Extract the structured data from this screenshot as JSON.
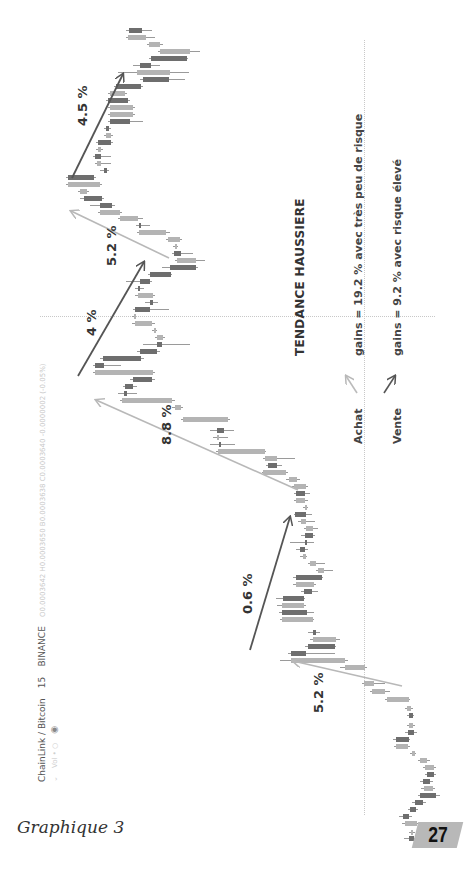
{
  "page": {
    "caption": "Graphique 3",
    "page_number": "27"
  },
  "tradingview_header": {
    "symbol": "ChainLink / Bitcoin",
    "interval": "15",
    "exchange": "BINANCE",
    "ohlc": "O0.0003642  H0.0003650  B0.0003638  C0.0003640  -0.0000002 (-0.05%)",
    "sub": "Vol  •  ○"
  },
  "annotations": {
    "title": "TENDANCE HAUSSIERE",
    "legend": [
      {
        "label": "Achat",
        "text": "gains = 19.2 % avec très peu de risque",
        "color": "#b0b0b0"
      },
      {
        "label": "Vente",
        "text": "gains = 9.2 % avec risque élevé",
        "color": "#555555"
      }
    ],
    "moves": [
      {
        "label": "5.2 %",
        "type": "achat"
      },
      {
        "label": "0.6 %",
        "type": "vente"
      },
      {
        "label": "8.8 %",
        "type": "achat"
      },
      {
        "label": "4 %",
        "type": "vente"
      },
      {
        "label": "5.2 %",
        "type": "achat"
      },
      {
        "label": "4.5 %",
        "type": "vente"
      }
    ]
  },
  "chart_data": {
    "type": "candlestick",
    "orientation": "rotated -90deg (time flows bottom to top, price increases to the left)",
    "xlabel": "time (15 min candles)",
    "ylabel": "price LINK/BTC",
    "grid": true,
    "annotations": [
      {
        "label": "5.2 %",
        "kind": "Achat (buy)",
        "direction": "up"
      },
      {
        "label": "0.6 %",
        "kind": "Vente (sell)",
        "direction": "up"
      },
      {
        "label": "8.8 %",
        "kind": "Achat (buy)",
        "direction": "up"
      },
      {
        "label": "4 %",
        "kind": "Vente (sell)",
        "direction": "up"
      },
      {
        "label": "5.2 %",
        "kind": "Achat (buy)",
        "direction": "up"
      },
      {
        "label": "4.5 %",
        "kind": "Vente (sell)",
        "direction": "up"
      }
    ],
    "summary": {
      "achat_total_gain_pct": 19.2,
      "vente_total_gain_pct": 9.2
    },
    "candles": [
      {
        "y": 836,
        "x1": 409,
        "x2": 414,
        "up": false,
        "w1": 404,
        "w2": 416
      },
      {
        "y": 830,
        "x1": 411,
        "x2": 413,
        "up": true,
        "w1": 409,
        "w2": 415
      },
      {
        "y": 821,
        "x1": 405,
        "x2": 417,
        "up": true,
        "w1": 402,
        "w2": 418
      },
      {
        "y": 814,
        "x1": 403,
        "x2": 409,
        "up": false,
        "w1": 399,
        "w2": 412
      },
      {
        "y": 807,
        "x1": 410,
        "x2": 416,
        "up": false,
        "w1": 408,
        "w2": 418
      },
      {
        "y": 800,
        "x1": 415,
        "x2": 423,
        "up": false,
        "w1": 412,
        "w2": 426
      },
      {
        "y": 793,
        "x1": 420,
        "x2": 436,
        "up": false,
        "w1": 418,
        "w2": 440
      },
      {
        "y": 786,
        "x1": 424,
        "x2": 433,
        "up": true,
        "w1": 421,
        "w2": 435
      },
      {
        "y": 779,
        "x1": 423,
        "x2": 430,
        "up": false,
        "w1": 420,
        "w2": 433
      },
      {
        "y": 772,
        "x1": 427,
        "x2": 434,
        "up": false,
        "w1": 425,
        "w2": 436
      },
      {
        "y": 765,
        "x1": 425,
        "x2": 434,
        "up": true,
        "w1": 423,
        "w2": 436
      },
      {
        "y": 758,
        "x1": 420,
        "x2": 427,
        "up": true,
        "w1": 418,
        "w2": 430
      },
      {
        "y": 751,
        "x1": 412,
        "x2": 415,
        "up": true,
        "w1": 410,
        "w2": 416
      },
      {
        "y": 744,
        "x1": 396,
        "x2": 408,
        "up": true,
        "w1": 394,
        "w2": 410
      },
      {
        "y": 737,
        "x1": 396,
        "x2": 409,
        "up": false,
        "w1": 393,
        "w2": 410
      },
      {
        "y": 730,
        "x1": 408,
        "x2": 414,
        "up": false,
        "w1": 405,
        "w2": 417
      },
      {
        "y": 723,
        "x1": 409,
        "x2": 413,
        "up": true,
        "w1": 407,
        "w2": 415
      },
      {
        "y": 713,
        "x1": 409,
        "x2": 413,
        "up": false,
        "w1": 407,
        "w2": 414
      },
      {
        "y": 706,
        "x1": 407,
        "x2": 411,
        "up": true,
        "w1": 405,
        "w2": 413
      },
      {
        "y": 697,
        "x1": 387,
        "x2": 409,
        "up": true,
        "w1": 385,
        "w2": 410
      },
      {
        "y": 689,
        "x1": 372,
        "x2": 385,
        "up": true,
        "w1": 370,
        "w2": 390
      },
      {
        "y": 681,
        "x1": 364,
        "x2": 374,
        "up": true,
        "w1": 362,
        "w2": 385
      },
      {
        "y": 665,
        "x1": 345,
        "x2": 365,
        "up": true,
        "w1": 340,
        "w2": 367
      },
      {
        "y": 658,
        "x1": 291,
        "x2": 345,
        "up": true,
        "w1": 280,
        "w2": 348
      },
      {
        "y": 651,
        "x1": 291,
        "x2": 306,
        "up": false,
        "w1": 288,
        "w2": 335
      },
      {
        "y": 644,
        "x1": 308,
        "x2": 335,
        "up": false,
        "w1": 305,
        "w2": 336
      },
      {
        "y": 637,
        "x1": 313,
        "x2": 336,
        "up": true,
        "w1": 310,
        "w2": 340
      },
      {
        "y": 630,
        "x1": 313,
        "x2": 316,
        "up": false,
        "w1": 308,
        "w2": 320
      },
      {
        "y": 617,
        "x1": 282,
        "x2": 313,
        "up": true,
        "w1": 280,
        "w2": 314
      },
      {
        "y": 610,
        "x1": 282,
        "x2": 307,
        "up": false,
        "w1": 279,
        "w2": 314
      },
      {
        "y": 603,
        "x1": 282,
        "x2": 304,
        "up": true,
        "w1": 277,
        "w2": 306
      },
      {
        "y": 596,
        "x1": 283,
        "x2": 304,
        "up": false,
        "w1": 276,
        "w2": 305
      },
      {
        "y": 589,
        "x1": 304,
        "x2": 312,
        "up": false,
        "w1": 301,
        "w2": 318
      },
      {
        "y": 582,
        "x1": 296,
        "x2": 314,
        "up": true,
        "w1": 293,
        "w2": 316
      },
      {
        "y": 575,
        "x1": 296,
        "x2": 322,
        "up": false,
        "w1": 293,
        "w2": 323
      },
      {
        "y": 568,
        "x1": 318,
        "x2": 324,
        "up": true,
        "w1": 316,
        "w2": 333
      },
      {
        "y": 561,
        "x1": 310,
        "x2": 316,
        "up": true,
        "w1": 308,
        "w2": 325
      },
      {
        "y": 554,
        "x1": 303,
        "x2": 306,
        "up": true,
        "w1": 300,
        "w2": 307
      },
      {
        "y": 547,
        "x1": 300,
        "x2": 305,
        "up": false,
        "w1": 296,
        "w2": 308
      },
      {
        "y": 540,
        "x1": 305,
        "x2": 306,
        "up": false,
        "w1": 290,
        "w2": 314
      },
      {
        "y": 533,
        "x1": 305,
        "x2": 313,
        "up": false,
        "w1": 301,
        "w2": 315
      },
      {
        "y": 526,
        "x1": 306,
        "x2": 313,
        "up": true,
        "w1": 304,
        "w2": 318
      },
      {
        "y": 519,
        "x1": 301,
        "x2": 306,
        "up": true,
        "w1": 298,
        "w2": 315
      },
      {
        "y": 512,
        "x1": 295,
        "x2": 306,
        "up": false,
        "w1": 294,
        "w2": 312
      },
      {
        "y": 505,
        "x1": 305,
        "x2": 307,
        "up": true,
        "w1": 303,
        "w2": 308
      },
      {
        "y": 498,
        "x1": 296,
        "x2": 305,
        "up": true,
        "w1": 294,
        "w2": 308
      },
      {
        "y": 491,
        "x1": 296,
        "x2": 305,
        "up": false,
        "w1": 294,
        "w2": 310
      },
      {
        "y": 484,
        "x1": 294,
        "x2": 306,
        "up": true,
        "w1": 292,
        "w2": 308
      },
      {
        "y": 477,
        "x1": 289,
        "x2": 297,
        "up": true,
        "w1": 286,
        "w2": 300
      },
      {
        "y": 470,
        "x1": 263,
        "x2": 286,
        "up": true,
        "w1": 262,
        "w2": 288
      },
      {
        "y": 463,
        "x1": 268,
        "x2": 277,
        "up": false,
        "w1": 266,
        "w2": 282
      },
      {
        "y": 456,
        "x1": 265,
        "x2": 277,
        "up": true,
        "w1": 263,
        "w2": 295
      },
      {
        "y": 449,
        "x1": 218,
        "x2": 265,
        "up": true,
        "w1": 216,
        "w2": 266
      },
      {
        "y": 442,
        "x1": 219,
        "x2": 221,
        "up": false,
        "w1": 210,
        "w2": 235
      },
      {
        "y": 435,
        "x1": 217,
        "x2": 219,
        "up": true,
        "w1": 213,
        "w2": 228
      },
      {
        "y": 428,
        "x1": 217,
        "x2": 224,
        "up": false,
        "w1": 210,
        "w2": 234
      },
      {
        "y": 417,
        "x1": 183,
        "x2": 228,
        "up": true,
        "w1": 181,
        "w2": 230
      },
      {
        "y": 405,
        "x1": 175,
        "x2": 181,
        "up": true,
        "w1": 172,
        "w2": 183
      },
      {
        "y": 398,
        "x1": 122,
        "x2": 172,
        "up": true,
        "w1": 120,
        "w2": 175
      },
      {
        "y": 391,
        "x1": 124,
        "x2": 127,
        "up": false,
        "w1": 118,
        "w2": 137
      },
      {
        "y": 384,
        "x1": 125,
        "x2": 133,
        "up": false,
        "w1": 123,
        "w2": 137
      },
      {
        "y": 377,
        "x1": 133,
        "x2": 152,
        "up": false,
        "w1": 130,
        "w2": 155
      },
      {
        "y": 370,
        "x1": 95,
        "x2": 153,
        "up": true,
        "w1": 93,
        "w2": 155
      },
      {
        "y": 363,
        "x1": 95,
        "x2": 104,
        "up": false,
        "w1": 93,
        "w2": 121
      },
      {
        "y": 356,
        "x1": 103,
        "x2": 141,
        "up": false,
        "w1": 100,
        "w2": 144
      },
      {
        "y": 349,
        "x1": 140,
        "x2": 157,
        "up": false,
        "w1": 137,
        "w2": 160
      },
      {
        "y": 342,
        "x1": 157,
        "x2": 162,
        "up": false,
        "w1": 143,
        "w2": 190
      },
      {
        "y": 335,
        "x1": 157,
        "x2": 163,
        "up": true,
        "w1": 155,
        "w2": 165
      },
      {
        "y": 328,
        "x1": 154,
        "x2": 156,
        "up": true,
        "w1": 152,
        "w2": 157
      },
      {
        "y": 321,
        "x1": 135,
        "x2": 152,
        "up": true,
        "w1": 132,
        "w2": 155
      },
      {
        "y": 314,
        "x1": 134,
        "x2": 135,
        "up": true,
        "w1": 132,
        "w2": 135
      },
      {
        "y": 307,
        "x1": 135,
        "x2": 150,
        "up": false,
        "w1": 133,
        "w2": 169
      },
      {
        "y": 300,
        "x1": 150,
        "x2": 153,
        "up": false,
        "w1": 145,
        "w2": 158
      },
      {
        "y": 293,
        "x1": 138,
        "x2": 153,
        "up": true,
        "w1": 135,
        "w2": 155
      },
      {
        "y": 286,
        "x1": 138,
        "x2": 140,
        "up": false,
        "w1": 135,
        "w2": 144
      },
      {
        "y": 279,
        "x1": 140,
        "x2": 150,
        "up": false,
        "w1": 126,
        "w2": 152
      },
      {
        "y": 272,
        "x1": 150,
        "x2": 171,
        "up": false,
        "w1": 148,
        "w2": 172
      },
      {
        "y": 265,
        "x1": 170,
        "x2": 196,
        "up": false,
        "w1": 162,
        "w2": 198
      },
      {
        "y": 258,
        "x1": 177,
        "x2": 196,
        "up": true,
        "w1": 175,
        "w2": 205
      },
      {
        "y": 251,
        "x1": 174,
        "x2": 181,
        "up": false,
        "w1": 172,
        "w2": 193
      },
      {
        "y": 244,
        "x1": 175,
        "x2": 177,
        "up": true,
        "w1": 173,
        "w2": 178
      },
      {
        "y": 237,
        "x1": 168,
        "x2": 180,
        "up": true,
        "w1": 166,
        "w2": 182
      },
      {
        "y": 230,
        "x1": 139,
        "x2": 166,
        "up": true,
        "w1": 137,
        "w2": 170
      },
      {
        "y": 223,
        "x1": 139,
        "x2": 140,
        "up": false,
        "w1": 136,
        "w2": 150
      },
      {
        "y": 216,
        "x1": 120,
        "x2": 138,
        "up": true,
        "w1": 118,
        "w2": 143
      },
      {
        "y": 210,
        "x1": 100,
        "x2": 120,
        "up": true,
        "w1": 98,
        "w2": 122
      },
      {
        "y": 203,
        "x1": 100,
        "x2": 112,
        "up": false,
        "w1": 90,
        "w2": 115
      },
      {
        "y": 196,
        "x1": 84,
        "x2": 102,
        "up": false,
        "w1": 80,
        "w2": 104
      },
      {
        "y": 189,
        "x1": 80,
        "x2": 87,
        "up": true,
        "w1": 78,
        "w2": 89
      },
      {
        "y": 182,
        "x1": 68,
        "x2": 100,
        "up": true,
        "w1": 66,
        "w2": 102
      },
      {
        "y": 175,
        "x1": 68,
        "x2": 94,
        "up": false,
        "w1": 66,
        "w2": 96
      },
      {
        "y": 168,
        "x1": 104,
        "x2": 107,
        "up": false,
        "w1": 100,
        "w2": 109
      },
      {
        "y": 161,
        "x1": 97,
        "x2": 101,
        "up": true,
        "w1": 95,
        "w2": 111
      },
      {
        "y": 154,
        "x1": 95,
        "x2": 101,
        "up": false,
        "w1": 93,
        "w2": 111
      },
      {
        "y": 147,
        "x1": 98,
        "x2": 101,
        "up": true,
        "w1": 96,
        "w2": 103
      },
      {
        "y": 140,
        "x1": 98,
        "x2": 111,
        "up": false,
        "w1": 96,
        "w2": 113
      },
      {
        "y": 133,
        "x1": 106,
        "x2": 111,
        "up": true,
        "w1": 104,
        "w2": 113
      },
      {
        "y": 126,
        "x1": 106,
        "x2": 109,
        "up": false,
        "w1": 104,
        "w2": 111
      },
      {
        "y": 119,
        "x1": 110,
        "x2": 130,
        "up": false,
        "w1": 108,
        "w2": 143
      },
      {
        "y": 112,
        "x1": 110,
        "x2": 133,
        "up": true,
        "w1": 108,
        "w2": 135
      },
      {
        "y": 105,
        "x1": 110,
        "x2": 133,
        "up": true,
        "w1": 108,
        "w2": 135
      },
      {
        "y": 98,
        "x1": 108,
        "x2": 128,
        "up": false,
        "w1": 106,
        "w2": 130
      },
      {
        "y": 91,
        "x1": 110,
        "x2": 125,
        "up": true,
        "w1": 108,
        "w2": 127
      },
      {
        "y": 84,
        "x1": 116,
        "x2": 141,
        "up": false,
        "w1": 114,
        "w2": 143
      },
      {
        "y": 77,
        "x1": 143,
        "x2": 169,
        "up": false,
        "w1": 140,
        "w2": 185
      },
      {
        "y": 70,
        "x1": 137,
        "x2": 170,
        "up": true,
        "w1": 118,
        "w2": 189
      },
      {
        "y": 63,
        "x1": 140,
        "x2": 151,
        "up": false,
        "w1": 133,
        "w2": 160
      },
      {
        "y": 56,
        "x1": 151,
        "x2": 187,
        "up": false,
        "w1": 149,
        "w2": 188
      },
      {
        "y": 49,
        "x1": 160,
        "x2": 190,
        "up": true,
        "w1": 158,
        "w2": 200
      },
      {
        "y": 42,
        "x1": 149,
        "x2": 160,
        "up": true,
        "w1": 147,
        "w2": 163
      },
      {
        "y": 35,
        "x1": 128,
        "x2": 146,
        "up": true,
        "w1": 126,
        "w2": 155
      },
      {
        "y": 28,
        "x1": 129,
        "x2": 142,
        "up": false,
        "w1": 126,
        "w2": 152
      }
    ]
  }
}
